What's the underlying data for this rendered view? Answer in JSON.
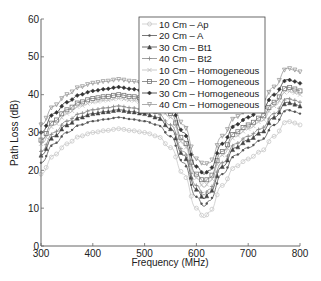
{
  "chart_data": {
    "type": "line",
    "title": "",
    "xlabel": "Frequency (MHz)",
    "ylabel": "Path Loss (dB)",
    "xlim": [
      300,
      800
    ],
    "ylim": [
      0,
      60
    ],
    "xticks": [
      300,
      400,
      500,
      600,
      700,
      800
    ],
    "yticks": [
      0,
      10,
      20,
      30,
      40,
      50,
      60
    ],
    "grid": false,
    "legend_position": "upper center",
    "x": [
      300,
      325,
      350,
      375,
      400,
      425,
      450,
      475,
      500,
      525,
      550,
      575,
      600,
      615,
      625,
      650,
      675,
      700,
      725,
      750,
      775,
      790,
      800
    ],
    "series": [
      {
        "name": "10 Cm – Ap",
        "marker": "o",
        "color": "#c8c8c8",
        "values": [
          19,
          24,
          27,
          29,
          30,
          30.5,
          31,
          30.5,
          30,
          29,
          26,
          19,
          10,
          7.5,
          9,
          16,
          21,
          23,
          25,
          29,
          33,
          32.5,
          32
        ]
      },
      {
        "name": "20 Cm – A",
        "marker": ".",
        "color": "#555555",
        "values": [
          22,
          27,
          30,
          32,
          33,
          33.5,
          34,
          33.5,
          33,
          32,
          29,
          22,
          13,
          10.5,
          12,
          19,
          24,
          26,
          28,
          32,
          36,
          35.5,
          35
        ]
      },
      {
        "name": "30 Cm – Bt1",
        "marker": "^",
        "color": "#444444",
        "values": [
          24,
          29,
          32,
          34,
          35,
          35.5,
          36,
          35.5,
          35,
          34,
          31,
          24,
          15,
          12.5,
          14,
          21,
          26,
          28,
          30,
          34,
          38,
          37.5,
          37
        ]
      },
      {
        "name": "40 Cm – Bt2",
        "marker": "+",
        "color": "#888888",
        "values": [
          25,
          30,
          33,
          35,
          36,
          36.5,
          37,
          36.5,
          36,
          35,
          32,
          25,
          16,
          13.5,
          15,
          22,
          27,
          29,
          31,
          35,
          39,
          38.5,
          38
        ]
      },
      {
        "name": "10 Cm –  Homogeneous",
        "marker": "x",
        "color": "#bbbbbb",
        "values": [
          27,
          32,
          35,
          37,
          38,
          38.5,
          39,
          38.5,
          38,
          37,
          34,
          27,
          18,
          15.5,
          17,
          24,
          29,
          31,
          33,
          37,
          41,
          40.5,
          40
        ]
      },
      {
        "name": "20 Cm –  Homogeneous",
        "marker": "s",
        "color": "#777777",
        "values": [
          28,
          33,
          36,
          38,
          39,
          39.5,
          40,
          39.5,
          39,
          38,
          35,
          28,
          19,
          17,
          18,
          25,
          30,
          32,
          34,
          38,
          42,
          41.5,
          41
        ]
      },
      {
        "name": "30 Cm –  Homogeneous",
        "marker": "d",
        "color": "#333333",
        "values": [
          30,
          35,
          38,
          40,
          41,
          41.5,
          42,
          41.5,
          41,
          40,
          37,
          30,
          21,
          19,
          20,
          27,
          32,
          34,
          36,
          40,
          44,
          43.5,
          43
        ]
      },
      {
        "name": "40 Cm –  Homogeneous",
        "marker": "v",
        "color": "#999999",
        "values": [
          32,
          37,
          40,
          42,
          43,
          43.5,
          44,
          43.5,
          43,
          42,
          39,
          32,
          23,
          21.5,
          22,
          29,
          34,
          36,
          38,
          42,
          47,
          46.5,
          46
        ]
      }
    ]
  },
  "plot": {
    "left": 41,
    "right": 300,
    "top": 19,
    "bottom": 246
  }
}
